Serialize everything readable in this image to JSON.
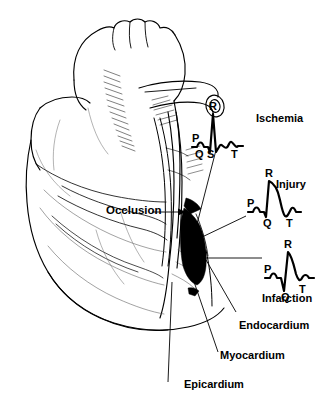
{
  "figure": {
    "background_color": "#ffffff",
    "ink_color": "#000000",
    "infarct_fill": "#000000"
  },
  "annotations": {
    "occlusion": "Occlusion",
    "endocardium": "Endocardium",
    "myocardium": "Myocardium",
    "epicardium": "Epicardium"
  },
  "ecg_traces": [
    {
      "id": "ischemia",
      "condition_label": "Ischemia",
      "description": "Inverted T wave",
      "wave_letters": {
        "p": "P",
        "q": "Q",
        "r": "R",
        "s": "S",
        "t": "T"
      }
    },
    {
      "id": "injury",
      "condition_label": "Injury",
      "description": "Elevated ST segment",
      "wave_letters": {
        "p": "P",
        "q": "Q",
        "r": "R",
        "t": "T"
      }
    },
    {
      "id": "infarction",
      "condition_label": "Infarction",
      "description": "Deep pathological Q wave",
      "wave_letters": {
        "p": "P",
        "q": "Q",
        "r": "R",
        "t": "T"
      }
    }
  ]
}
